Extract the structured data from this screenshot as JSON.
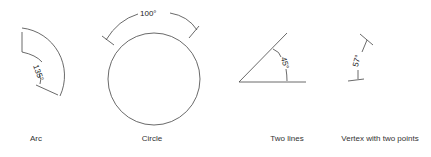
{
  "figures": [
    {
      "caption": "Arc",
      "angle_label": "135°"
    },
    {
      "caption": "Circle",
      "angle_label": "100°"
    },
    {
      "caption": "Two lines",
      "angle_label": "45°"
    },
    {
      "caption": "Vertex with two points",
      "angle_label": "57°"
    }
  ],
  "colors": {
    "stroke": "#333333",
    "text": "#222222",
    "background": "#ffffff"
  }
}
